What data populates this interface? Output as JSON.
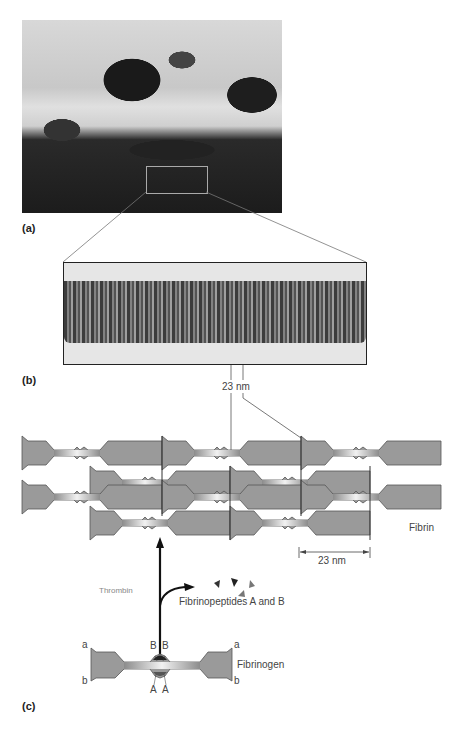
{
  "panels": {
    "a": {
      "label": "(a)",
      "description": "scanning electron micrograph of fibrin clot with red blood cells"
    },
    "b": {
      "label": "(b)",
      "description": "electron micrograph of single fibrin fiber with banding"
    },
    "c": {
      "label": "(c)"
    }
  },
  "measurements": {
    "banding_period_top": "23 nm",
    "banding_period_scale": "23 nm"
  },
  "labels": {
    "fibrin": "Fibrin",
    "thrombin": "Thrombin",
    "fibrinopeptides": "Fibrinopeptides A and B",
    "fibrinogen": "Fibrinogen",
    "end_a_left": "a",
    "end_b_left": "b",
    "end_a_right": "a",
    "end_b_right": "b",
    "site_B1": "B",
    "site_B2": "B",
    "site_A1": "A",
    "site_A2": "A"
  },
  "colors": {
    "molecule_fill": "#9a9a9a",
    "molecule_stroke": "#555555",
    "arrow": "#111111",
    "peptide_dark": "#333333",
    "peptide_mid": "#777777"
  }
}
